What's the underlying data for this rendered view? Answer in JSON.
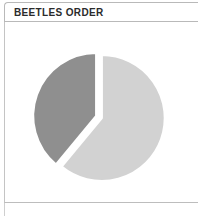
{
  "panel": {
    "title": "BEETLES ORDER"
  },
  "chart_data": {
    "type": "pie",
    "title": "BEETLES ORDER",
    "subtitle": "",
    "xlabel": "",
    "ylabel": "",
    "legend": "none",
    "grid": false,
    "labels": [
      "Slice 1",
      "Slice 2"
    ],
    "values": [
      61,
      39
    ],
    "colors": [
      "#d2d2d2",
      "#8f8f8f"
    ],
    "exploded": true,
    "start_angle_deg": 0,
    "geometry": {
      "center_x": 99,
      "center_y": 117,
      "radius": 63
    },
    "slices": [
      {
        "label": "Slice 1",
        "value": 61,
        "percent": 61,
        "color": "#d2d2d2",
        "start_deg": 0,
        "end_deg": 219.6
      },
      {
        "label": "Slice 2",
        "value": 39,
        "percent": 39,
        "color": "#8f8f8f",
        "start_deg": 219.6,
        "end_deg": 360
      }
    ]
  }
}
